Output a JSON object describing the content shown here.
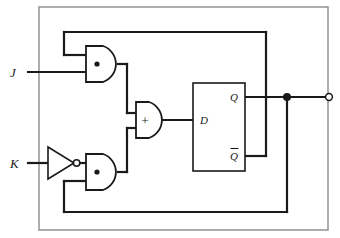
{
  "diagram": {
    "stroke_color": "#1a1a1a",
    "border_color": "#8a8a8a",
    "background": "#ffffff"
  },
  "inputs": [
    {
      "name": "j-input",
      "label": "J"
    },
    {
      "name": "k-input",
      "label": "K"
    }
  ],
  "gates": [
    {
      "name": "and-gate-top",
      "type": "and",
      "symbol": "•"
    },
    {
      "name": "and-gate-bottom",
      "type": "and",
      "symbol": "•"
    },
    {
      "name": "or-gate",
      "type": "or",
      "symbol": "+"
    },
    {
      "name": "not-gate",
      "type": "not",
      "symbol": ""
    }
  ],
  "flipflop": {
    "name": "d-flip-flop",
    "input_label": "D",
    "output_label": "Q",
    "inverted_output_label": "Q",
    "inverted_output_overbar": true
  },
  "output": {
    "name": "output-terminal",
    "label": ""
  },
  "nodes": [
    {
      "name": "q-junction-dot",
      "label": ""
    }
  ]
}
